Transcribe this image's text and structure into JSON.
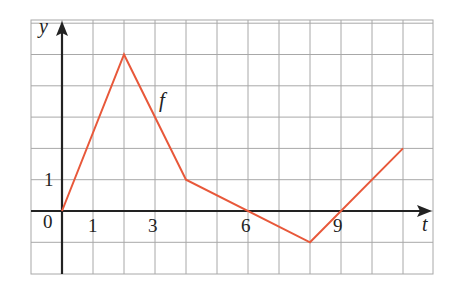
{
  "chart_data": {
    "type": "line",
    "title": "",
    "xlabel": "t",
    "ylabel": "y",
    "series": [
      {
        "name": "f",
        "x": [
          0,
          2,
          4,
          6,
          8,
          9,
          11
        ],
        "values": [
          0,
          5,
          1,
          0,
          -1,
          0,
          2
        ]
      }
    ],
    "vertices": [
      [
        0,
        0
      ],
      [
        2,
        5
      ],
      [
        4,
        1
      ],
      [
        8,
        -1
      ],
      [
        11,
        2
      ]
    ],
    "x_tick_labels": [
      "0",
      "1",
      "3",
      "6",
      "9"
    ],
    "x_tick_values": [
      0,
      1,
      3,
      6,
      9
    ],
    "y_tick_labels": [
      "1"
    ],
    "y_tick_values": [
      1
    ],
    "xlim": [
      -1,
      12
    ],
    "ylim": [
      -2,
      6
    ],
    "grid": true,
    "grid_spacing": 1,
    "legend": "none",
    "annotations": [
      {
        "text": "f",
        "x": 3.3,
        "y": 3.5
      }
    ]
  },
  "labels": {
    "x_axis": "t",
    "y_axis": "y",
    "function": "f",
    "origin": "0",
    "x1": "1",
    "x3": "3",
    "x6": "6",
    "x9": "9",
    "y1": "1"
  },
  "colors": {
    "line": "#e8583a",
    "grid": "#a8a8a8",
    "axis": "#222222",
    "background": "#ffffff"
  }
}
